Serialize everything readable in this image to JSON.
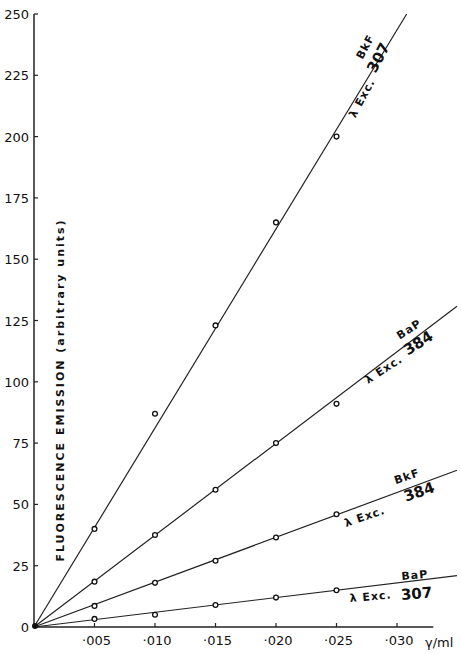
{
  "chart_data": {
    "type": "line",
    "title": "",
    "xlabel": "γ/ml",
    "ylabel": "FLUORESCENCE   EMISSION   (arbitrary units)",
    "xlim": [
      0,
      0.033
    ],
    "ylim": [
      0,
      250
    ],
    "x_ticks": [
      0.005,
      0.01,
      0.015,
      0.02,
      0.025,
      0.03
    ],
    "x_tick_labels": [
      "·005",
      "·010",
      "·015",
      "·020",
      "·025",
      "·030"
    ],
    "y_ticks": [
      0,
      25,
      50,
      75,
      100,
      125,
      150,
      175,
      200,
      225,
      250
    ],
    "y_tick_labels": [
      "0",
      "25",
      "50",
      "75",
      "100",
      "125",
      "150",
      "175",
      "200",
      "225",
      "250"
    ],
    "grid": false,
    "legend": "inline labels along lines",
    "series": [
      {
        "name": "BkF λ Exc. 307",
        "compound": "BkF",
        "excitation": "307",
        "x": [
          0,
          0.005,
          0.01,
          0.015,
          0.02,
          0.025
        ],
        "values": [
          0,
          40,
          87,
          123,
          165,
          200
        ],
        "fit_end": [
          0.0308,
          250
        ]
      },
      {
        "name": "BaP λ Exc. 384",
        "compound": "BaP",
        "excitation": "384",
        "x": [
          0,
          0.005,
          0.01,
          0.015,
          0.02,
          0.025
        ],
        "values": [
          0,
          18.5,
          37.5,
          56,
          75,
          91
        ],
        "fit_end": [
          0.035,
          131
        ]
      },
      {
        "name": "BkF λ Exc. 384",
        "compound": "BkF",
        "excitation": "384",
        "x": [
          0,
          0.005,
          0.01,
          0.015,
          0.02,
          0.025
        ],
        "values": [
          0,
          8.6,
          18,
          27,
          36.5,
          46
        ],
        "fit_end": [
          0.035,
          64
        ]
      },
      {
        "name": "BaP λ Exc. 307",
        "compound": "BaP",
        "excitation": "307",
        "x": [
          0,
          0.005,
          0.01,
          0.015,
          0.02,
          0.025
        ],
        "values": [
          0,
          3.3,
          5,
          9,
          12,
          15
        ],
        "fit_end": [
          0.035,
          21
        ]
      }
    ]
  },
  "labels": {
    "exc_prefix": "λ Exc.",
    "bkf": "BkF",
    "bap": "BaP",
    "n307": "307",
    "n384": "384"
  }
}
